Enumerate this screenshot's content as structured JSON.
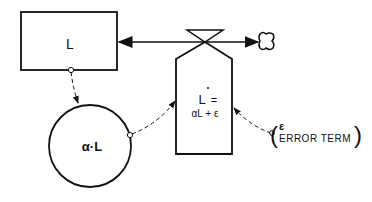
{
  "diagram": {
    "type": "stock-and-flow",
    "colors": {
      "stroke": "#111111",
      "background": "#ffffff"
    },
    "nodes": {
      "stock": {
        "label": "L"
      },
      "auxiliary": {
        "label": "α·L"
      },
      "rate": {
        "label_line1": "L̇ =",
        "dot": "·",
        "label_L": "L",
        "label_eq": "=",
        "label_line2": "αL + ε"
      },
      "error": {
        "symbol": "ε",
        "label": "ERROR TERM",
        "open_paren": "(",
        "close_paren": ")"
      }
    },
    "icons": {
      "valve": "valve-icon",
      "cloud": "cloud-sink-icon"
    }
  }
}
